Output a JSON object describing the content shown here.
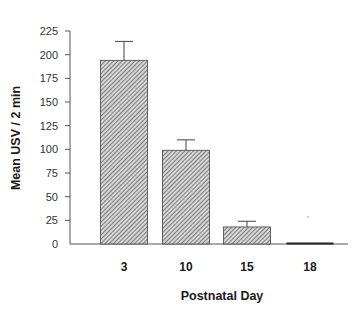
{
  "chart_data": {
    "type": "bar",
    "title": "",
    "xlabel": "Postnatal Day",
    "ylabel": "Mean USV / 2 min",
    "categories": [
      "3",
      "10",
      "15",
      "18"
    ],
    "values": [
      194,
      99,
      18,
      1
    ],
    "error_upper": [
      214,
      110,
      24,
      1
    ],
    "ylim": [
      0,
      225
    ],
    "yticks": [
      0,
      25,
      50,
      75,
      100,
      125,
      150,
      175,
      200,
      225
    ],
    "grid": false,
    "legend": null,
    "bar_fill": "diagonal-hatch",
    "bar_color": "#9a9a9a",
    "axis_color": "#555555"
  }
}
